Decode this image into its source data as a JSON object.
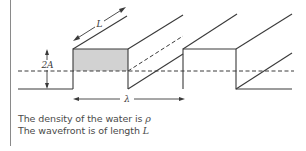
{
  "diagram": {
    "labels": {
      "amplitude": "2A",
      "length": "L",
      "wavelength": "λ"
    },
    "colors": {
      "line": "#3a3a3a",
      "fill": "#d2d2d2",
      "border": "#8a8a8a"
    }
  },
  "captions": [
    {
      "text": "The density of the water is ",
      "symbol": "ρ"
    },
    {
      "text": "The wavefront is of length ",
      "symbol": "L"
    }
  ]
}
